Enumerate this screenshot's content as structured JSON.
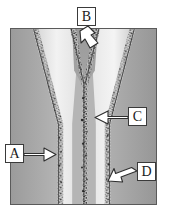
{
  "figure": {
    "kind": "micrograph-diagram",
    "frame_border_color": "#5a5a5a",
    "background_color": "#ffffff"
  },
  "callouts": [
    {
      "id": "a",
      "label": "A",
      "name": "callout-a",
      "arrow_direction": "right",
      "target": "left vertical grain boundary",
      "box": {
        "x": 5,
        "y": 144,
        "w": 19,
        "h": 19
      }
    },
    {
      "id": "b",
      "label": "B",
      "name": "callout-b",
      "arrow_direction": "down",
      "target": "apex of the V-shaped junction",
      "box": {
        "x": 77,
        "y": 7,
        "w": 19,
        "h": 19
      }
    },
    {
      "id": "c",
      "label": "C",
      "name": "callout-c",
      "arrow_direction": "left",
      "target": "central speckled boundary",
      "box": {
        "x": 128,
        "y": 107,
        "w": 19,
        "h": 19
      }
    },
    {
      "id": "d",
      "label": "D",
      "name": "callout-d",
      "arrow_direction": "left",
      "target": "right vertical grain boundary",
      "box": {
        "x": 137,
        "y": 162,
        "w": 19,
        "h": 19
      }
    }
  ],
  "regions": {
    "outer_left_grain": {
      "name": "left-dark-grain",
      "fill": "#a8a8a8"
    },
    "outer_right_grain": {
      "name": "right-dark-grain",
      "fill": "#a0a0a0"
    },
    "inner_left_grain": {
      "name": "inner-left-light-grain",
      "fill": "#e2e2e2"
    },
    "inner_right_grain": {
      "name": "inner-right-light-grain",
      "fill": "#dcdcdc"
    },
    "wedge": {
      "name": "central-wedge-grain",
      "fill": "#9e9e9e"
    },
    "boundary_speckle": {
      "name": "grain-boundary-speckle",
      "fill": "#3b3b3b"
    }
  },
  "colors": {
    "label_text": "#1a1a1a",
    "label_border": "#3a3a3a",
    "label_fill": "#ffffff",
    "arrow_fill": "#ffffff",
    "arrow_stroke": "#2e2e2e"
  }
}
